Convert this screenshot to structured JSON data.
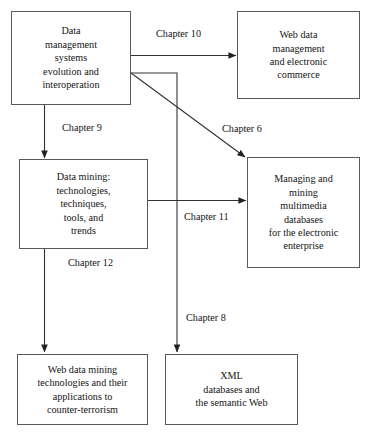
{
  "diagram": {
    "type": "flowchart",
    "title": "",
    "nodes": [
      {
        "id": "dms",
        "label": "Data\nmanagement\nsystems\nevolution and\ninteroperation"
      },
      {
        "id": "webdata",
        "label": "Web data\nmanagement\nand electronic\ncommerce"
      },
      {
        "id": "datamining",
        "label": "Data mining:\ntechnologies,\ntechniques,\ntools, and\ntrends"
      },
      {
        "id": "multimedia",
        "label": "Managing and\nmining\nmultimedia\ndatabases\nfor the electronic\nenterprise"
      },
      {
        "id": "counterterror",
        "label": "Web data mining\ntechnologies and their\napplications to\ncounter-terrorism"
      },
      {
        "id": "xml",
        "label": "XML\ndatabases and\nthe semantic Web"
      }
    ],
    "edges": [
      {
        "id": "e10",
        "label": "Chapter 10",
        "from": "dms",
        "to": "webdata"
      },
      {
        "id": "e9",
        "label": "Chapter 9",
        "from": "dms",
        "to": "datamining"
      },
      {
        "id": "e6",
        "label": "Chapter 6",
        "from": "dms",
        "to": "multimedia"
      },
      {
        "id": "e8",
        "label": "Chapter 8",
        "from": "dms",
        "to": "xml"
      },
      {
        "id": "e11",
        "label": "Chapter 11",
        "from": "datamining",
        "to": "multimedia"
      },
      {
        "id": "e12",
        "label": "Chapter 12",
        "from": "datamining",
        "to": "counterterror"
      }
    ],
    "colors": {
      "box_border": "#555a5e",
      "line": "#333333",
      "text": "#141414",
      "background": "#ffffff"
    }
  }
}
